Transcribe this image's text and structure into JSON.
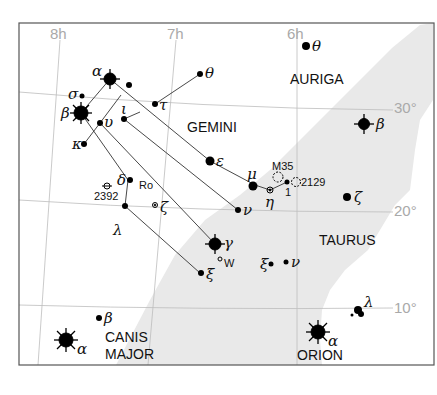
{
  "map": {
    "grid": {
      "ra_labels": [
        "8h",
        "7h",
        "6h"
      ],
      "dec_labels": [
        "30°",
        "20°",
        "10°"
      ]
    },
    "constellations": [
      {
        "name": "GEMINI"
      },
      {
        "name": "AURIGA"
      },
      {
        "name": "TAURUS"
      },
      {
        "name": "CANIS",
        "name2": "MAJOR"
      },
      {
        "name": "ORION"
      }
    ],
    "stars": {
      "gem_alpha": "α",
      "gem_beta": "β",
      "gem_sigma": "σ",
      "gem_kappa": "κ",
      "gem_upsilon": "υ",
      "gem_iota": "ι",
      "gem_tau": "τ",
      "gem_theta": "θ",
      "gem_epsilon": "ε",
      "gem_mu": "μ",
      "gem_eta": "η",
      "gem_one": "1",
      "gem_nu": "ν",
      "gem_delta": "δ",
      "gem_zeta": "ζ",
      "gem_lambda": "λ",
      "gem_gamma": "γ",
      "gem_xi": "ξ",
      "aur_theta": "θ",
      "tau_beta": "β",
      "tau_zeta": "ζ",
      "ori_xi": "ξ",
      "ori_nu": "ν",
      "ori_lambda": "λ",
      "ori_alpha": "α",
      "cma_alpha": "α",
      "cma_beta": "β"
    },
    "objects": {
      "m35": "M35",
      "ngc2129": "2129",
      "ngc2392": "2392",
      "ro": "Ro",
      "w": "W"
    },
    "colors": {
      "milky_way": "#e9e9e9",
      "grid": "#b8b8b8",
      "frame": "#555555",
      "lines": "#333333",
      "stars": "#000000"
    }
  }
}
